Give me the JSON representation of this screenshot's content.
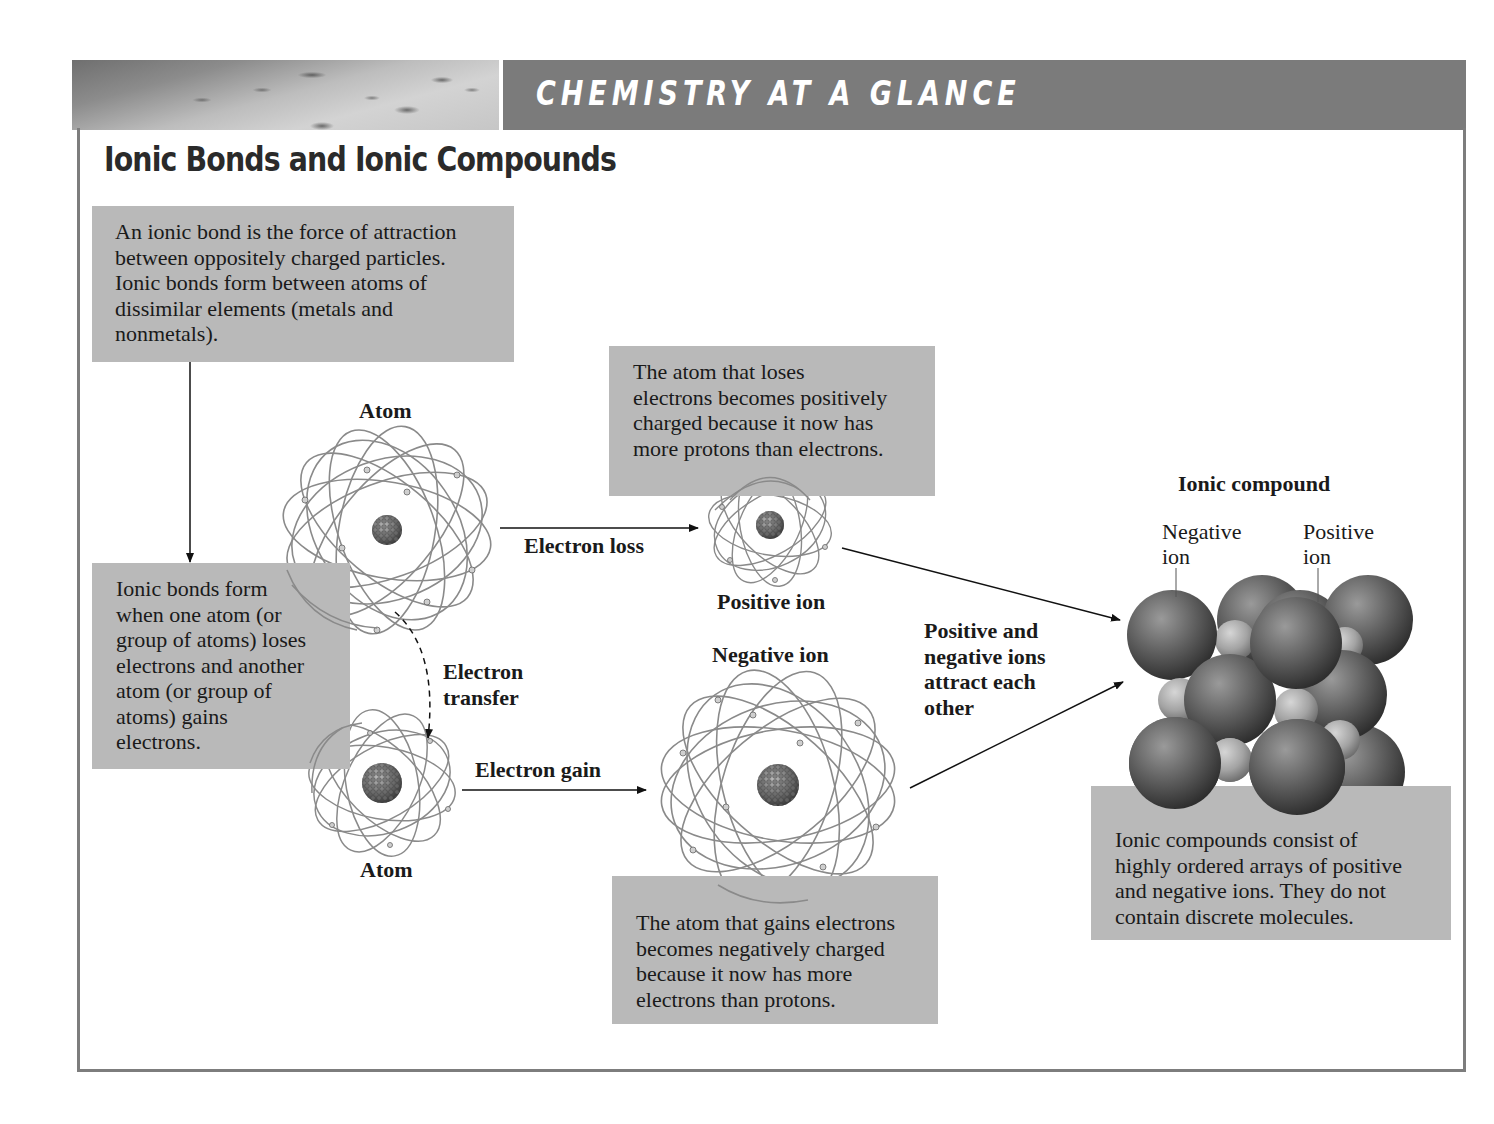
{
  "header": {
    "banner_title": "CHEMISTRY AT A GLANCE",
    "page_title": "Ionic Bonds and Ionic Compounds"
  },
  "boxes": {
    "definition": "An ionic bond is the force of attraction\nbetween oppositely charged particles.\nIonic bonds form between atoms of\ndissimilar elements (metals and\nnonmetals).",
    "formation": "Ionic bonds form\nwhen one atom (or\ngroup of atoms) loses\nelectrons and another\natom (or group of\natoms) gains\nelectrons.",
    "positive_explanation": "The atom that loses\nelectrons becomes positively\ncharged because it now has\nmore protons than electrons.",
    "negative_explanation": "The atom that gains electrons\nbecomes negatively charged\nbecause it now has more\nelectrons than protons.",
    "compound_explanation": "Ionic compounds consist of\nhighly ordered arrays of positive\nand negative ions. They do not\ncontain discrete molecules."
  },
  "labels": {
    "atom_top": "Atom",
    "atom_bottom": "Atom",
    "electron_loss": "Electron loss",
    "electron_gain": "Electron gain",
    "electron_transfer": "Electron\ntransfer",
    "positive_ion": "Positive ion",
    "negative_ion": "Negative ion",
    "attraction": "Positive and\nnegative ions\nattract each\nother",
    "ionic_compound": "Ionic compound",
    "lattice_negative_ion": "Negative\nion",
    "lattice_positive_ion": "Positive\nion"
  },
  "colors": {
    "banner": "#7b7b7b",
    "box_fill": "#b9b9b9",
    "frame": "#7d7d7d",
    "sphere_dark": "#5e5e5e",
    "sphere_light": "#a8a8a8"
  }
}
